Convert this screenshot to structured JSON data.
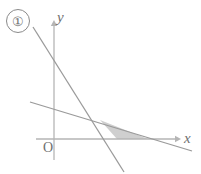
{
  "figure": {
    "label": "①",
    "label_icon": "circled-digit-one",
    "background_color": "#ffffff",
    "stroke_color": "#9a9a9a",
    "axis_color": "#b5b5b5",
    "text_color": "#6f6f6f",
    "shade_fill": "#cfcfcf",
    "width": 201,
    "height": 174
  },
  "axes": {
    "x_label": "x",
    "y_label": "y",
    "origin_label": "O",
    "x_axis_arrow": "arrow-right",
    "y_axis_arrow": "arrow-up",
    "origin_px": {
      "x": 54,
      "y": 139
    },
    "x_axis_extent_px": {
      "from_x": 36,
      "to_x": 181,
      "y": 139
    },
    "y_axis_extent_px": {
      "x": 54,
      "from_y": 160,
      "to_y": 20
    }
  },
  "chart_data": {
    "type": "line",
    "title": "",
    "xlabel": "x",
    "ylabel": "y",
    "grid": false,
    "legend_position": "none",
    "annotations": [
      "①",
      "O"
    ],
    "series": [
      {
        "name": "steep-line",
        "description": "steeply decreasing line crossing the x-axis inside the shaded region",
        "points_px": [
          {
            "x": 33,
            "y": 27
          },
          {
            "x": 124,
            "y": 172
          }
        ],
        "x_intercept_px": {
          "x": 117,
          "y": 139
        }
      },
      {
        "name": "shallow-line",
        "description": "gently decreasing line crossing the x-axis to the right of the shaded region",
        "points_px": [
          {
            "x": 30,
            "y": 102
          },
          {
            "x": 192,
            "y": 151
          }
        ],
        "x_intercept_px": {
          "x": 148,
          "y": 139
        }
      }
    ],
    "intersection_px": {
      "x": 100,
      "y": 120
    },
    "shaded_region": {
      "name": "shaded-triangle",
      "fill": "#cfcfcf",
      "vertices_px": [
        {
          "x": 100,
          "y": 120
        },
        {
          "x": 117,
          "y": 139
        },
        {
          "x": 148,
          "y": 139
        }
      ]
    }
  }
}
